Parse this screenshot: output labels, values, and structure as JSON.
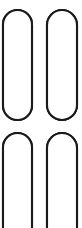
{
  "figure": {
    "background_color": "#ffffff",
    "stroke_color": "#1a1a1a",
    "fill_gray": "#c9c9c9",
    "fill_white": "#ffffff",
    "canvas": {
      "width": 82,
      "height": 228
    },
    "columns": [
      {
        "id": "column-top-left",
        "label": "Top left capsule",
        "x": 3,
        "width": 29,
        "top": 10,
        "bottom": 120,
        "round_top": true,
        "round_bottom": true,
        "corner_radius": 14.5,
        "dividers": [
          44,
          74,
          107
        ],
        "cells": [
          {
            "label": "cell-1",
            "top": 10,
            "bottom": 44,
            "marker": "triangle-up",
            "fill": "gray"
          },
          {
            "label": "cell-2",
            "top": 44,
            "bottom": 74,
            "marker": "triangle-up",
            "fill": "gray"
          },
          {
            "label": "cell-3",
            "top": 74,
            "bottom": 107,
            "marker": "triangle-up",
            "fill": "gray"
          },
          {
            "label": "cell-4",
            "top": 107,
            "bottom": 120,
            "marker": "none",
            "fill": "white"
          }
        ]
      },
      {
        "id": "column-top-right",
        "label": "Top right capsule",
        "x": 47,
        "width": 30,
        "top": 10,
        "bottom": 120,
        "round_top": true,
        "round_bottom": true,
        "corner_radius": 15,
        "dividers": [
          44,
          74,
          107
        ],
        "cells": [
          {
            "label": "cell-1",
            "top": 10,
            "bottom": 44,
            "marker": "triangle-up",
            "fill": "gray"
          },
          {
            "label": "cell-2",
            "top": 44,
            "bottom": 74,
            "marker": "triangle-up",
            "fill": "gray"
          },
          {
            "label": "cell-3",
            "top": 74,
            "bottom": 107,
            "marker": "triangle-up",
            "fill": "gray"
          },
          {
            "label": "cell-4",
            "top": 107,
            "bottom": 120,
            "marker": "none",
            "fill": "white"
          }
        ]
      },
      {
        "id": "column-bottom-left",
        "label": "Bottom left capsule",
        "x": 3,
        "width": 29,
        "top": 133,
        "bottom": 232,
        "round_top": true,
        "round_bottom": false,
        "corner_radius": 14.5,
        "dividers": [
          164,
          192
        ],
        "cells": [
          {
            "label": "cell-1",
            "top": 133,
            "bottom": 164,
            "marker": "triangle-up",
            "fill": "white"
          },
          {
            "label": "cell-2",
            "top": 164,
            "bottom": 192,
            "marker": "triangle-up",
            "fill": "white"
          },
          {
            "label": "cell-3",
            "top": 192,
            "bottom": 232,
            "marker": "triangle-up",
            "fill": "white"
          }
        ]
      },
      {
        "id": "column-bottom-right",
        "label": "Bottom right capsule",
        "x": 47,
        "width": 30,
        "top": 133,
        "bottom": 232,
        "round_top": true,
        "round_bottom": false,
        "corner_radius": 15,
        "dividers": [
          164,
          192
        ],
        "cells": [
          {
            "label": "cell-1",
            "top": 133,
            "bottom": 164,
            "marker": "triangle-up",
            "fill": "gray"
          },
          {
            "label": "cell-2",
            "top": 164,
            "bottom": 192,
            "marker": "triangle-up",
            "fill": "gray"
          },
          {
            "label": "cell-3",
            "top": 192,
            "bottom": 232,
            "marker": "triangle-up",
            "fill": "gray"
          }
        ]
      }
    ]
  }
}
